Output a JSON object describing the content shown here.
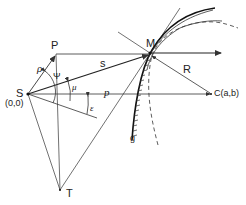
{
  "figure": {
    "type": "geometric-diagram",
    "colors": {
      "line": "#333333",
      "background": "#ffffff"
    }
  },
  "points": {
    "S": {
      "label": "S",
      "coord_label": "(0,0)"
    },
    "P": {
      "label": "P"
    },
    "M": {
      "label": "M"
    },
    "C": {
      "label": "C(a,b)"
    },
    "T": {
      "label": "T"
    }
  },
  "segments": {
    "rho": {
      "label": "ρ"
    },
    "s": {
      "label": "s"
    },
    "p": {
      "label": "p"
    },
    "R": {
      "label": "R"
    }
  },
  "angles": {
    "psi": {
      "label": "Ψ"
    },
    "mu": {
      "label": "μ"
    },
    "epsilon": {
      "label": "ε"
    }
  },
  "curves": {
    "g": {
      "label": "g"
    }
  }
}
